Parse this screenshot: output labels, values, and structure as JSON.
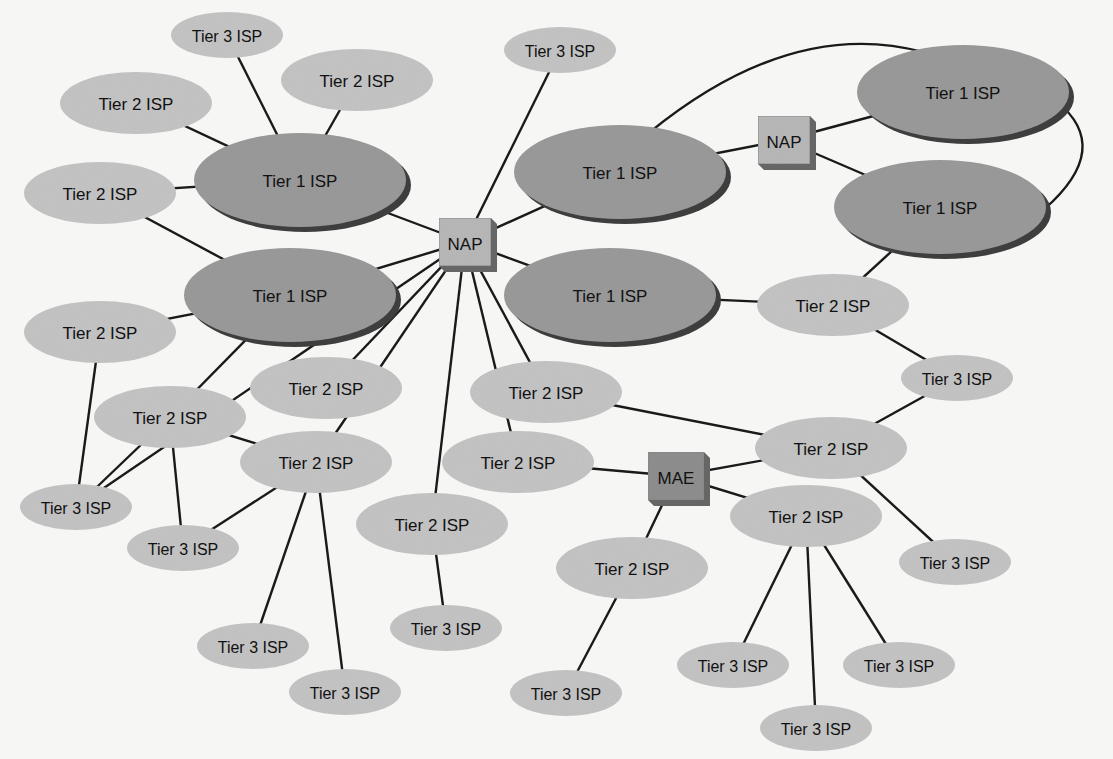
{
  "diagram": {
    "type": "network-topology",
    "colors": {
      "background": "#f6f6f4",
      "tier1_fill": "#9a9a9a",
      "tier1_shadow": "#3e3e3e",
      "tier2_fill": "#c4c4c4",
      "tier3_fill": "#c4c4c4",
      "nap_fill": "#b8b8b8",
      "mae_fill": "#8e8e8e",
      "line": "#1a1a1a"
    },
    "nodes": [
      {
        "id": "t3a",
        "kind": "tier3",
        "label": "Tier 3 ISP",
        "x": 227,
        "y": 35
      },
      {
        "id": "t2a",
        "kind": "tier2",
        "label": "Tier 2 ISP",
        "x": 136,
        "y": 103
      },
      {
        "id": "t2b",
        "kind": "tier2",
        "label": "Tier 2 ISP",
        "x": 357,
        "y": 80
      },
      {
        "id": "t3b",
        "kind": "tier3",
        "label": "Tier 3 ISP",
        "x": 560,
        "y": 50
      },
      {
        "id": "t2c",
        "kind": "tier2",
        "label": "Tier 2 ISP",
        "x": 100,
        "y": 193
      },
      {
        "id": "t1a",
        "kind": "tier1",
        "label": "Tier 1 ISP",
        "x": 300,
        "y": 180
      },
      {
        "id": "t1b",
        "kind": "tier1",
        "label": "Tier 1 ISP",
        "x": 620,
        "y": 172
      },
      {
        "id": "nap1",
        "kind": "nap",
        "label": "NAP",
        "x": 465,
        "y": 242
      },
      {
        "id": "nap2",
        "kind": "nap",
        "label": "NAP",
        "x": 784,
        "y": 140
      },
      {
        "id": "t1c",
        "kind": "tier1",
        "label": "Tier 1 ISP",
        "x": 963,
        "y": 92
      },
      {
        "id": "t1d",
        "kind": "tier1",
        "label": "Tier 1 ISP",
        "x": 940,
        "y": 207
      },
      {
        "id": "t1e",
        "kind": "tier1",
        "label": "Tier 1 ISP",
        "x": 290,
        "y": 295
      },
      {
        "id": "t1f",
        "kind": "tier1",
        "label": "Tier 1 ISP",
        "x": 610,
        "y": 295
      },
      {
        "id": "t2d",
        "kind": "tier2",
        "label": "Tier 2 ISP",
        "x": 100,
        "y": 332
      },
      {
        "id": "t2e",
        "kind": "tier2",
        "label": "Tier 2 ISP",
        "x": 833,
        "y": 305
      },
      {
        "id": "t3c",
        "kind": "tier3",
        "label": "Tier 3 ISP",
        "x": 957,
        "y": 378
      },
      {
        "id": "t2f",
        "kind": "tier2",
        "label": "Tier 2 ISP",
        "x": 170,
        "y": 417
      },
      {
        "id": "t2g",
        "kind": "tier2",
        "label": "Tier 2 ISP",
        "x": 326,
        "y": 388
      },
      {
        "id": "t2h",
        "kind": "tier2",
        "label": "Tier 2 ISP",
        "x": 546,
        "y": 392
      },
      {
        "id": "t2i",
        "kind": "tier2",
        "label": "Tier 2 ISP",
        "x": 316,
        "y": 462
      },
      {
        "id": "t2j",
        "kind": "tier2",
        "label": "Tier 2 ISP",
        "x": 518,
        "y": 462
      },
      {
        "id": "mae",
        "kind": "mae",
        "label": "MAE",
        "x": 676,
        "y": 476
      },
      {
        "id": "t2k",
        "kind": "tier2",
        "label": "Tier 2 ISP",
        "x": 831,
        "y": 448
      },
      {
        "id": "t3d",
        "kind": "tier3",
        "label": "Tier 3 ISP",
        "x": 76,
        "y": 507
      },
      {
        "id": "t3e",
        "kind": "tier3",
        "label": "Tier 3 ISP",
        "x": 183,
        "y": 548
      },
      {
        "id": "t2l",
        "kind": "tier2",
        "label": "Tier 2 ISP",
        "x": 432,
        "y": 524
      },
      {
        "id": "t2m",
        "kind": "tier2",
        "label": "Tier 2 ISP",
        "x": 806,
        "y": 516
      },
      {
        "id": "t3f",
        "kind": "tier3",
        "label": "Tier 3 ISP",
        "x": 955,
        "y": 562
      },
      {
        "id": "t2n",
        "kind": "tier2",
        "label": "Tier 2 ISP",
        "x": 632,
        "y": 568
      },
      {
        "id": "t3g",
        "kind": "tier3",
        "label": "Tier 3 ISP",
        "x": 446,
        "y": 628
      },
      {
        "id": "t3h",
        "kind": "tier3",
        "label": "Tier 3 ISP",
        "x": 253,
        "y": 646
      },
      {
        "id": "t3i",
        "kind": "tier3",
        "label": "Tier 3 ISP",
        "x": 345,
        "y": 692
      },
      {
        "id": "t3j",
        "kind": "tier3",
        "label": "Tier 3 ISP",
        "x": 733,
        "y": 665
      },
      {
        "id": "t3k",
        "kind": "tier3",
        "label": "Tier 3 ISP",
        "x": 899,
        "y": 665
      },
      {
        "id": "t3l",
        "kind": "tier3",
        "label": "Tier 3 ISP",
        "x": 816,
        "y": 728
      },
      {
        "id": "t3m",
        "kind": "tier3",
        "label": "Tier 3 ISP",
        "x": 566,
        "y": 693
      }
    ],
    "edges": [
      [
        "t1a",
        "t3a"
      ],
      [
        "t1a",
        "t2a"
      ],
      [
        "t1a",
        "t2b"
      ],
      [
        "t1a",
        "t2c"
      ],
      [
        "t1a",
        "nap1"
      ],
      [
        "t2c",
        "t1e"
      ],
      [
        "t1e",
        "t2d"
      ],
      [
        "t1e",
        "t2f"
      ],
      [
        "t1e",
        "nap1"
      ],
      [
        "nap1",
        "t3b"
      ],
      [
        "nap1",
        "t1b"
      ],
      [
        "nap1",
        "t1f"
      ],
      [
        "nap1",
        "t2g"
      ],
      [
        "nap1",
        "t2i"
      ],
      [
        "nap1",
        "t2j"
      ],
      [
        "nap1",
        "t3d"
      ],
      [
        "nap1",
        "t2h"
      ],
      [
        "nap1",
        "t2l"
      ],
      [
        "t1b",
        "nap2"
      ],
      [
        "nap2",
        "t1c"
      ],
      [
        "nap2",
        "t1d"
      ],
      [
        "t1d",
        "t2e"
      ],
      [
        "t1f",
        "t2e"
      ],
      [
        "t2e",
        "t3c"
      ],
      [
        "t2h",
        "t2k"
      ],
      [
        "t2j",
        "mae"
      ],
      [
        "mae",
        "t2k"
      ],
      [
        "mae",
        "t2m"
      ],
      [
        "mae",
        "t2n"
      ],
      [
        "t2k",
        "t3c"
      ],
      [
        "t2k",
        "t3f"
      ],
      [
        "t2d",
        "t3d"
      ],
      [
        "t2f",
        "t3d"
      ],
      [
        "t2f",
        "t3e"
      ],
      [
        "t2f",
        "t2i"
      ],
      [
        "t2i",
        "t3e"
      ],
      [
        "t2i",
        "t3h"
      ],
      [
        "t2i",
        "t3i"
      ],
      [
        "t2l",
        "t3g"
      ],
      [
        "t2m",
        "t3j"
      ],
      [
        "t2m",
        "t3k"
      ],
      [
        "t2m",
        "t3l"
      ],
      [
        "t2n",
        "t3m"
      ]
    ],
    "curves": [
      {
        "from": "t1b",
        "to": "t1c",
        "label": "tier1-peer-arc-top"
      },
      {
        "from": "t1c",
        "to": "t1d",
        "label": "tier1-peer-arc-right"
      }
    ]
  }
}
